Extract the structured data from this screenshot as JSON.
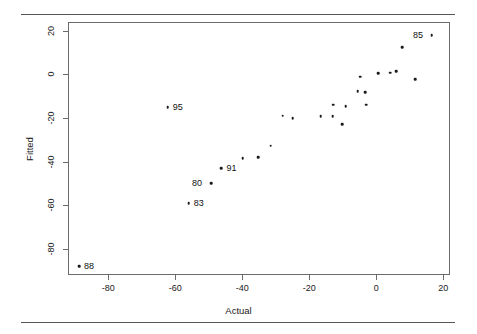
{
  "chart_data": {
    "type": "scatter",
    "title": "",
    "xlabel": "Actual",
    "ylabel": "Fitted",
    "xlim": [
      -92,
      22
    ],
    "ylim": [
      -92,
      24
    ],
    "xticks": [
      -80,
      -60,
      -40,
      -20,
      0,
      20
    ],
    "yticks": [
      -80,
      -60,
      -40,
      -20,
      0,
      20
    ],
    "xticklabels": [
      "-80",
      "-60",
      "-40",
      "-20",
      "0",
      "20"
    ],
    "yticklabels": [
      "-80",
      "-60",
      "-40",
      "-20",
      "0",
      "20"
    ],
    "grid": false,
    "legend": null,
    "marker": "dot",
    "marker_color": "#1a1a1a",
    "points": [
      {
        "x": -89.0,
        "y": -87.5,
        "label": "88",
        "label_pos": "right"
      },
      {
        "x": -62.5,
        "y": -14.7,
        "label": "95",
        "label_pos": "right"
      },
      {
        "x": -56.3,
        "y": -58.5,
        "label": "83",
        "label_pos": "right"
      },
      {
        "x": -49.6,
        "y": -49.5,
        "label": "80",
        "label_pos": "left"
      },
      {
        "x": -46.5,
        "y": -42.5,
        "label": "91",
        "label_pos": "right"
      },
      {
        "x": -40.2,
        "y": -38.0,
        "label": null,
        "label_pos": null
      },
      {
        "x": -35.6,
        "y": -37.5,
        "label": null,
        "label_pos": null
      },
      {
        "x": -31.8,
        "y": -32.3,
        "label": null,
        "label_pos": null
      },
      {
        "x": -28.2,
        "y": -18.5,
        "label": null,
        "label_pos": null
      },
      {
        "x": -25.3,
        "y": -19.6,
        "label": null,
        "label_pos": null
      },
      {
        "x": -16.9,
        "y": -18.6,
        "label": null,
        "label_pos": null
      },
      {
        "x": -13.3,
        "y": -18.7,
        "label": null,
        "label_pos": null
      },
      {
        "x": -13.1,
        "y": -13.4,
        "label": null,
        "label_pos": null
      },
      {
        "x": -10.4,
        "y": -22.4,
        "label": null,
        "label_pos": null
      },
      {
        "x": -9.4,
        "y": -14.2,
        "label": null,
        "label_pos": null
      },
      {
        "x": -5.8,
        "y": -7.2,
        "label": null,
        "label_pos": null
      },
      {
        "x": -5.1,
        "y": -0.7,
        "label": null,
        "label_pos": null
      },
      {
        "x": -3.6,
        "y": -7.6,
        "label": null,
        "label_pos": null
      },
      {
        "x": -3.3,
        "y": -13.5,
        "label": null,
        "label_pos": null
      },
      {
        "x": 0.2,
        "y": 1.1,
        "label": null,
        "label_pos": null
      },
      {
        "x": 3.8,
        "y": 1.2,
        "label": null,
        "label_pos": null
      },
      {
        "x": 5.6,
        "y": 1.8,
        "label": null,
        "label_pos": null
      },
      {
        "x": 7.4,
        "y": 13.0,
        "label": null,
        "label_pos": null
      },
      {
        "x": 11.3,
        "y": -1.8,
        "label": null,
        "label_pos": null
      },
      {
        "x": 16.3,
        "y": 18.4,
        "label": "85",
        "label_pos": "left"
      }
    ]
  },
  "colors": {
    "frame": "#6b6b6b",
    "rule": "#555555",
    "marker": "#1a1a1a",
    "text": "#1a1a1a",
    "background": "#ffffff"
  }
}
